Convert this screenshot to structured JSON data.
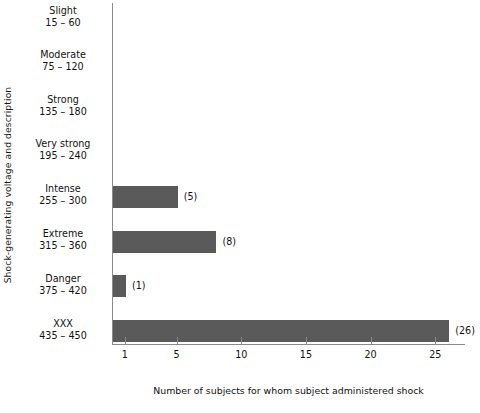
{
  "chart_data": {
    "type": "bar",
    "orientation": "horizontal",
    "title": "",
    "xlabel": "Number of subjects for whom subject administered shock",
    "ylabel": "Shock-generating voltage and description",
    "categories": [
      "Slight 15 – 60",
      "Moderate 75 – 120",
      "Strong 135 – 180",
      "Very strong 195 – 240",
      "Intense 255 – 300",
      "Extreme 315 – 360",
      "Danger 375 – 420",
      "XXX 435 – 450"
    ],
    "category_names": [
      "Slight",
      "Moderate",
      "Strong",
      "Very strong",
      "Intense",
      "Extreme",
      "Danger",
      "XXX"
    ],
    "category_ranges": [
      "15 – 60",
      "75 – 120",
      "135 – 180",
      "195 – 240",
      "255 – 300",
      "315 – 360",
      "375 – 420",
      "435 – 450"
    ],
    "values": [
      0,
      0,
      0,
      0,
      5,
      8,
      1,
      26
    ],
    "value_labels": [
      "",
      "",
      "",
      "",
      "(5)",
      "(8)",
      "(1)",
      "(26)"
    ],
    "xticks": [
      1,
      5,
      10,
      15,
      20,
      25
    ],
    "xtick_labels": [
      "1",
      "5",
      "10",
      "15",
      "20",
      "25"
    ],
    "xlim": [
      0,
      27.3
    ],
    "grid": false,
    "legend": "none",
    "bar_color": "#5a5a5a",
    "axis_color": "#8a8a8a",
    "background": "#ffffff"
  },
  "axes": {
    "y_title": "Shock-generating voltage and description",
    "x_title": "Number of subjects for whom subject administered shock"
  }
}
